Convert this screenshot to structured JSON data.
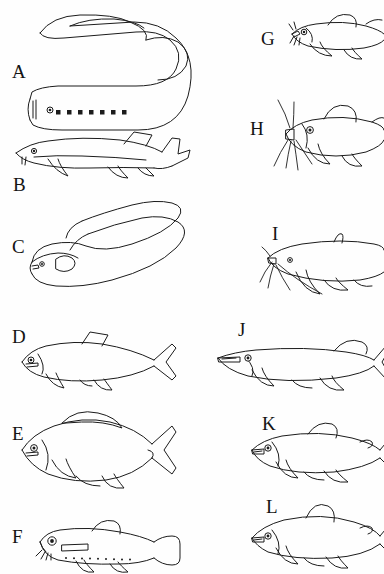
{
  "figure": {
    "kind": "scientific-plate",
    "background_color": "#ffffff",
    "ink_color": "#1b1b1b",
    "columns": 2,
    "panel_count": 12
  },
  "panels": [
    {
      "id": "A",
      "label": "A",
      "label_x": 12,
      "label_y": 62,
      "common_name": "lamprey",
      "icon": "lamprey-icon",
      "feature_note": "eel-like body curved into a U, row of seven gill pores behind the eye, sucker mouth, no paired fins",
      "gill_pore_count": 7,
      "x": 18,
      "y": 6,
      "w": 170,
      "h": 124
    },
    {
      "id": "B",
      "label": "B",
      "label_x": 13,
      "label_y": 175,
      "common_name": "sturgeon",
      "icon": "sturgeon-icon",
      "feature_note": "elongate body, pointed snout with barbels, heterocercal upturned tail, dorsal fin set far back",
      "x": 12,
      "y": 126,
      "w": 182,
      "h": 54
    },
    {
      "id": "C",
      "label": "C",
      "label_x": 12,
      "label_y": 237,
      "common_name": "eel",
      "icon": "eel-icon",
      "feature_note": "very long snake-like body looped back on itself, continuous median fin, small pectoral fin",
      "x": 26,
      "y": 196,
      "w": 158,
      "h": 100
    },
    {
      "id": "D",
      "label": "D",
      "label_x": 12,
      "label_y": 327,
      "common_name": "herring-like fish",
      "icon": "herring-icon",
      "feature_note": "fusiform streamlined body, single triangular dorsal fin, deeply forked caudal fin",
      "x": 16,
      "y": 330,
      "w": 166,
      "h": 62
    },
    {
      "id": "E",
      "label": "E",
      "label_x": 12,
      "label_y": 424,
      "common_name": "carp-like fish",
      "icon": "carp-icon",
      "feature_note": "deep-bodied fish with long-based dorsal fin and forked tail",
      "x": 16,
      "y": 410,
      "w": 166,
      "h": 82
    },
    {
      "id": "F",
      "label": "F",
      "label_x": 12,
      "label_y": 527,
      "common_name": "deep-sea lanternfish",
      "icon": "lanternfish-icon",
      "feature_note": "small slender fish with large head and eye, photophore row along belly, squared caudal fin",
      "x": 34,
      "y": 518,
      "w": 146,
      "h": 52
    },
    {
      "id": "G",
      "label": "G",
      "label_x": 261,
      "label_y": 29,
      "common_name": "bullhead catfish",
      "icon": "bullhead-catfish-icon",
      "feature_note": "scaleless body, short barbels around mouth, rounded dorsal and adipose fins",
      "x": 288,
      "y": 12,
      "w": 96,
      "h": 48
    },
    {
      "id": "H",
      "label": "H",
      "label_x": 250,
      "label_y": 119,
      "common_name": "channel catfish",
      "icon": "channel-catfish-icon",
      "feature_note": "broad flattened head with eight long barbels, high dorsal fin, deeply forked tail",
      "x": 272,
      "y": 96,
      "w": 112,
      "h": 78
    },
    {
      "id": "I",
      "label": "I",
      "label_x": 272,
      "label_y": 224,
      "common_name": "catfish",
      "icon": "catfish-icon",
      "feature_note": "elongate catfish with long barbels streaming back, long anal fin",
      "x": 262,
      "y": 230,
      "w": 122,
      "h": 72
    },
    {
      "id": "J",
      "label": "J",
      "label_x": 238,
      "label_y": 320,
      "common_name": "pike",
      "icon": "pike-icon",
      "feature_note": "long duck-bill snout, dorsal fin far back opposite the anal fin, forked tail",
      "x": 216,
      "y": 334,
      "w": 168,
      "h": 60
    },
    {
      "id": "K",
      "label": "K",
      "label_x": 262,
      "label_y": 414,
      "common_name": "whitefish",
      "icon": "whitefish-icon",
      "feature_note": "salmonid with small adipose fin behind the dorsal fin and forked tail",
      "x": 248,
      "y": 424,
      "w": 136,
      "h": 58
    },
    {
      "id": "L",
      "label": "L",
      "label_x": 266,
      "label_y": 497,
      "common_name": "cisco",
      "icon": "cisco-icon",
      "feature_note": "salmonid with terminal mouth, tall dorsal fin and adipose fin",
      "x": 248,
      "y": 504,
      "w": 136,
      "h": 60
    }
  ]
}
